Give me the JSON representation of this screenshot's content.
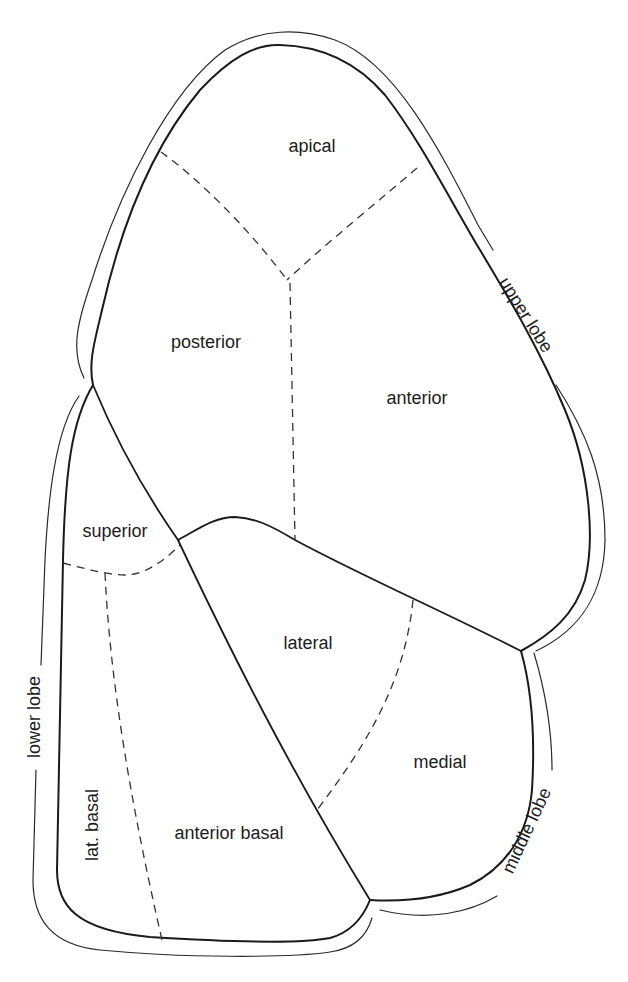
{
  "diagram": {
    "lobes": [
      {
        "id": "upper",
        "label": "upper lobe"
      },
      {
        "id": "middle",
        "label": "middle lobe"
      },
      {
        "id": "lower",
        "label": "lower lobe"
      }
    ],
    "segments": {
      "apical": "apical",
      "posterior": "posterior",
      "anterior": "anterior",
      "superior": "superior",
      "lateral": "lateral",
      "medial": "medial",
      "lat_basal": "lat. basal",
      "anterior_basal": "anterior basal"
    },
    "line_styles": {
      "lobe_boundary": "solid",
      "segment_boundary": "dashed"
    },
    "colors": {
      "line": "#1a1a1a",
      "text": "#1c1c1c",
      "background": "#ffffff"
    }
  }
}
